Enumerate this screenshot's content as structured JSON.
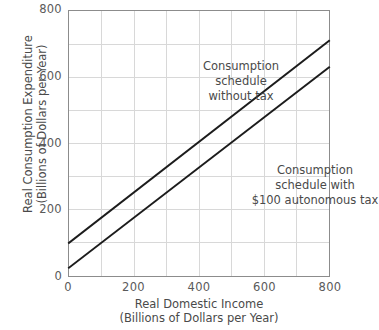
{
  "chart_data": {
    "type": "line",
    "title": "",
    "xlabel": "Real Domestic Income",
    "xlabel_units": "(Billions of Dollars per Year)",
    "ylabel": "Real Consumption Expenditure",
    "ylabel_units": "(Billions of Dollars per Year)",
    "xlim": [
      0,
      800
    ],
    "ylim": [
      0,
      800
    ],
    "xticks": [
      0,
      200,
      400,
      600,
      800
    ],
    "yticks": [
      0,
      200,
      400,
      600,
      800
    ],
    "xtick_labels": [
      "0",
      "200",
      "400",
      "600",
      "800"
    ],
    "ytick_labels": [
      "0",
      "200",
      "400",
      "600",
      "800"
    ],
    "grid": true,
    "grid_step": 100,
    "legend": "none",
    "series": [
      {
        "name": "Consumption schedule without tax",
        "color": "#1c1c1c",
        "x": [
          0,
          800
        ],
        "values": [
          100,
          710
        ],
        "intercept": 100,
        "slope": 0.7625
      },
      {
        "name": "Consumption schedule with $100 autonomous tax",
        "color": "#1c1c1c",
        "x": [
          0,
          800
        ],
        "values": [
          25,
          630
        ],
        "intercept": 25,
        "slope": 0.7563
      }
    ],
    "annotations": [
      {
        "id": "no-tax",
        "lines": [
          "Consumption",
          "schedule",
          "without tax"
        ],
        "x": 330,
        "y": 640
      },
      {
        "id": "with-tax",
        "lines": [
          "Consumption",
          "schedule with",
          "$100 autonomous tax"
        ],
        "x": 540,
        "y": 330
      }
    ]
  },
  "axes": {
    "y_title_line1": "Real Consumption Expenditure",
    "y_title_line2": "(Billions of Dollars per Year)",
    "x_title_line1": "Real Domestic Income",
    "x_title_line2": "(Billions of Dollars per Year)"
  },
  "annotations": {
    "no_tax": {
      "line1": "Consumption",
      "line2": "schedule",
      "line3": "without tax"
    },
    "with_tax": {
      "line1": "Consumption",
      "line2": "schedule with",
      "line3": "$100 autonomous tax"
    }
  },
  "colors": {
    "background": "#ffffff",
    "line": "#1c1c1c",
    "grid": "#d8d8d8",
    "frame": "#8c8c8c",
    "tick_text": "#5a5a5a",
    "label_text": "#4a4a4a"
  }
}
